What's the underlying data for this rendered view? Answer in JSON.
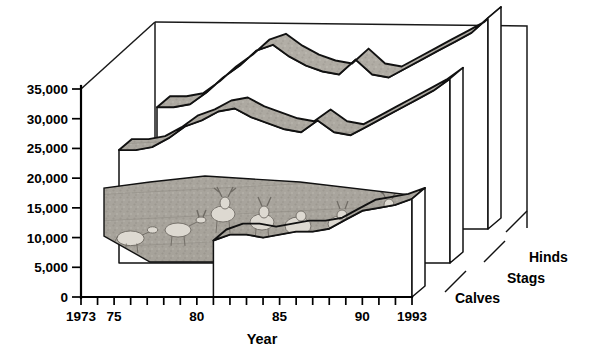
{
  "chart_data": {
    "type": "area",
    "title": "",
    "xlabel": "Year",
    "ylabel": "",
    "ylim": [
      0,
      35000
    ],
    "yticks": [
      0,
      5000,
      10000,
      15000,
      20000,
      25000,
      30000,
      35000
    ],
    "ytick_labels": [
      "0",
      "5,000",
      "10,000",
      "15,000",
      "20,000",
      "25,000",
      "30,000",
      "35,000"
    ],
    "grid": false,
    "legend_position": "right-depth-axis",
    "x": [
      1973,
      1974,
      1975,
      1976,
      1977,
      1978,
      1979,
      1980,
      1981,
      1982,
      1983,
      1984,
      1985,
      1986,
      1987,
      1988,
      1989,
      1990,
      1991,
      1992,
      1993
    ],
    "xtick_labels": [
      "1973",
      "75",
      "80",
      "85",
      "90",
      "1993"
    ],
    "xtick_label_years": [
      1973,
      1975,
      1980,
      1985,
      1990,
      1993
    ],
    "series": [
      {
        "name": "Hinds",
        "values": [
          20500,
          20500,
          21000,
          23000,
          25500,
          27500,
          30000,
          31000,
          29000,
          27500,
          26500,
          26000,
          28500,
          26000,
          25500,
          27000,
          28500,
          30000,
          31500,
          33000,
          35500
        ]
      },
      {
        "name": "Stags",
        "values": [
          19000,
          19000,
          19500,
          21000,
          23000,
          24000,
          25500,
          26000,
          24500,
          23500,
          22500,
          22000,
          24000,
          22000,
          21500,
          23000,
          24500,
          26000,
          27500,
          29000,
          31000
        ]
      },
      {
        "name": "Calves",
        "values": [
          0,
          0,
          0,
          0,
          0,
          0,
          0,
          0,
          9500,
          10500,
          10500,
          10000,
          10500,
          11000,
          11000,
          11500,
          13000,
          14500,
          15000,
          15500,
          16500
        ]
      }
    ],
    "annotations": [
      "3D ribbon/area chart with photographic deer herd image filling the plot surfaces"
    ]
  },
  "axes": {
    "y_axis_name": "population-axis",
    "x_axis_name": "year-axis",
    "x_title": "Year"
  },
  "legend": {
    "items": [
      {
        "label": "Hinds"
      },
      {
        "label": "Stags"
      },
      {
        "label": "Calves"
      }
    ]
  },
  "colors": {
    "background": "#ffffff",
    "line": "#111111",
    "ribbon_fill": "#a8a49c",
    "ribbon_fill_light": "#c9c5bd",
    "side_face": "#b8b4ac",
    "text": "#000000"
  }
}
